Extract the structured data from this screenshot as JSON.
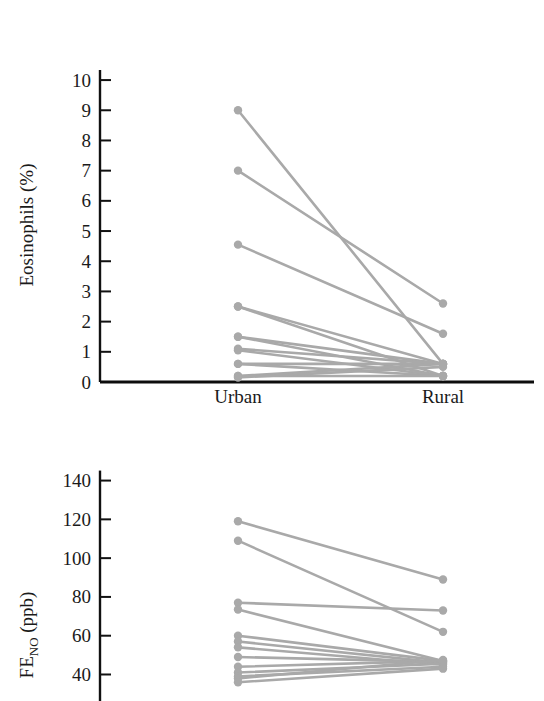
{
  "figure": {
    "background": "#ffffff",
    "series_color": "#a9a9a9",
    "axis_color": "#111111"
  },
  "chart_data": [
    {
      "type": "line",
      "name": "eosinophils-slope-chart",
      "title": "",
      "subtitle": "",
      "xlabel": "",
      "ylabel": "Eosinophils (%)",
      "categories": [
        "Urban",
        "Rural"
      ],
      "yticks": [
        0,
        1,
        2,
        3,
        4,
        5,
        6,
        7,
        8,
        9,
        10
      ],
      "yticklabels": [
        "0",
        "1",
        "2",
        "3",
        "4",
        "5",
        "6",
        "7",
        "8",
        "9",
        "10"
      ],
      "ylim": [
        0,
        10.4
      ],
      "grid": false,
      "legend": "none",
      "marker": "circle",
      "paired": true,
      "series": [
        {
          "name": "subject-1",
          "values": [
            9.0,
            0.6
          ]
        },
        {
          "name": "subject-2",
          "values": [
            7.0,
            2.6
          ]
        },
        {
          "name": "subject-3",
          "values": [
            4.55,
            1.6
          ]
        },
        {
          "name": "subject-4",
          "values": [
            2.5,
            0.6
          ]
        },
        {
          "name": "subject-5",
          "values": [
            2.5,
            0.2
          ]
        },
        {
          "name": "subject-6",
          "values": [
            1.5,
            0.6
          ]
        },
        {
          "name": "subject-7",
          "values": [
            1.5,
            0.2
          ]
        },
        {
          "name": "subject-8",
          "values": [
            1.1,
            0.6
          ]
        },
        {
          "name": "subject-9",
          "values": [
            1.05,
            0.2
          ]
        },
        {
          "name": "subject-10",
          "values": [
            0.6,
            0.6
          ]
        },
        {
          "name": "subject-11",
          "values": [
            0.6,
            0.2
          ]
        },
        {
          "name": "subject-12",
          "values": [
            0.2,
            0.6
          ]
        },
        {
          "name": "subject-13",
          "values": [
            0.2,
            0.2
          ]
        },
        {
          "name": "subject-14",
          "values": [
            0.15,
            0.5
          ]
        }
      ]
    },
    {
      "type": "line",
      "name": "feno-slope-chart",
      "title": "",
      "subtitle": "",
      "xlabel": "",
      "ylabel": "FE_NO (ppb)",
      "ylabel_main": "FE",
      "ylabel_sub": "NO",
      "ylabel_unit": " (ppb)",
      "categories": [
        "Urban",
        "Rural"
      ],
      "yticks": [
        40,
        60,
        80,
        100,
        120,
        140
      ],
      "yticklabels": [
        "40",
        "60",
        "80",
        "100",
        "120",
        "140"
      ],
      "ylim": [
        32,
        147
      ],
      "grid": false,
      "legend": "none",
      "marker": "circle",
      "paired": true,
      "cropped_at_bottom": true,
      "series": [
        {
          "name": "subject-1",
          "values": [
            119.0,
            89.0
          ]
        },
        {
          "name": "subject-2",
          "values": [
            109.0,
            62.0
          ]
        },
        {
          "name": "subject-3",
          "values": [
            77.0,
            73.0
          ]
        },
        {
          "name": "subject-4",
          "values": [
            73.5,
            47.0
          ]
        },
        {
          "name": "subject-5",
          "values": [
            60.0,
            47.0
          ]
        },
        {
          "name": "subject-6",
          "values": [
            57.0,
            46.0
          ]
        },
        {
          "name": "subject-7",
          "values": [
            54.0,
            45.0
          ]
        },
        {
          "name": "subject-8",
          "values": [
            49.0,
            46.5
          ]
        },
        {
          "name": "subject-9",
          "values": [
            44.0,
            47.0
          ]
        },
        {
          "name": "subject-10",
          "values": [
            41.0,
            45.5
          ]
        },
        {
          "name": "subject-11",
          "values": [
            39.0,
            44.0
          ]
        },
        {
          "name": "subject-12",
          "values": [
            38.0,
            47.5
          ]
        },
        {
          "name": "subject-13",
          "values": [
            36.0,
            43.0
          ]
        }
      ]
    }
  ]
}
